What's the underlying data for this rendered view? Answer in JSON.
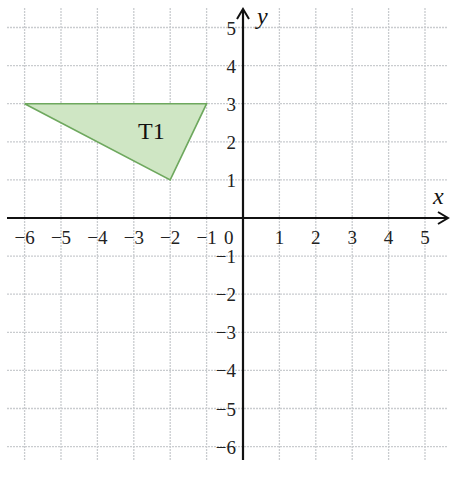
{
  "chart_data": {
    "type": "coordinate-grid",
    "xlabel": "x",
    "ylabel": "y",
    "xlim": [
      -6,
      5
    ],
    "ylim": [
      -6,
      5
    ],
    "x_ticks": [
      -6,
      -5,
      -4,
      -3,
      -2,
      -1,
      1,
      2,
      3,
      4,
      5
    ],
    "y_ticks": [
      5,
      4,
      3,
      2,
      1,
      -1,
      -2,
      -3,
      -4,
      -5,
      -6
    ],
    "origin_label": "0",
    "grid": true,
    "shapes": [
      {
        "name": "T1",
        "label": "T1",
        "type": "triangle",
        "vertices": [
          [
            -6,
            3
          ],
          [
            -1,
            3
          ],
          [
            -2,
            1
          ]
        ],
        "fill": "#cfe6c4",
        "stroke": "#6ea85e"
      }
    ]
  },
  "labels": {
    "x_axis": "x",
    "y_axis": "y",
    "origin": "0",
    "shape": "T1",
    "x_ticks": [
      "−6",
      "−5",
      "−4",
      "−3",
      "−2",
      "−1",
      "1",
      "2",
      "3",
      "4",
      "5"
    ],
    "y_ticks": [
      "5",
      "4",
      "3",
      "2",
      "1",
      "−1",
      "−2",
      "−3",
      "−4",
      "−5",
      "−6"
    ]
  },
  "colors": {
    "grid": "#c9cccf",
    "axis": "#111111",
    "fill": "#cfe6c4",
    "stroke": "#6ea85e"
  }
}
